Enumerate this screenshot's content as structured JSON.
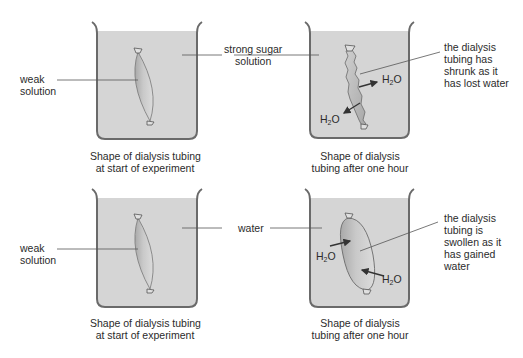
{
  "colors": {
    "liquid": "#d4d4d4",
    "glass": "#6e6e6e",
    "line": "#555555",
    "tubing_fill": "#c2c2c2",
    "text": "#2b2b2b"
  },
  "panels": [
    {
      "id": "top-left",
      "left_label": [
        "weak",
        "solution"
      ],
      "caption": [
        "Shape of dialysis tubing",
        "at start of experiment"
      ],
      "tubing_state": "normal"
    },
    {
      "id": "top-right",
      "right_label": [
        "the dialysis",
        "tubing has",
        "shrunk as it",
        "has lost water"
      ],
      "caption": [
        "Shape of dialysis",
        "tubing after one hour"
      ],
      "tubing_state": "shrunk",
      "arrows": [
        {
          "label_main": "H",
          "label_sub": "2",
          "label_end": "O",
          "direction": "outward-right"
        },
        {
          "label_main": "H",
          "label_sub": "2",
          "label_end": "O",
          "direction": "outward-left"
        }
      ]
    },
    {
      "id": "bottom-left",
      "left_label": [
        "weak",
        "solution"
      ],
      "caption": [
        "Shape of dialysis tubing",
        "at start of experiment"
      ],
      "tubing_state": "normal"
    },
    {
      "id": "bottom-right",
      "right_label": [
        "the dialysis",
        "tubing is",
        "swollen as it",
        "has gained",
        "water"
      ],
      "caption": [
        "Shape of dialysis",
        "tubing after one hour"
      ],
      "tubing_state": "swollen",
      "arrows": [
        {
          "label_main": "H",
          "label_sub": "2",
          "label_end": "O",
          "direction": "inward-from-left"
        },
        {
          "label_main": "H",
          "label_sub": "2",
          "label_end": "O",
          "direction": "inward-from-right"
        }
      ]
    }
  ],
  "shared_labels": {
    "top_middle": [
      "strong sugar",
      "solution"
    ],
    "bottom_middle": "water"
  }
}
